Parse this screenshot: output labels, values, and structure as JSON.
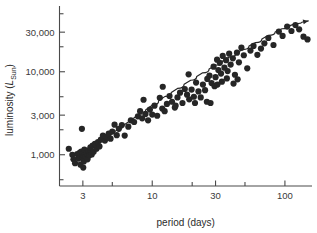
{
  "chart_data": {
    "type": "scatter",
    "title": "",
    "xlabel": "period (days)",
    "ylabel_main": "luminosity (",
    "ylabel_sub": "L",
    "ylabel_subsub": "Sun",
    "ylabel_close": ")",
    "xscale": "log",
    "yscale": "log",
    "xlim": [
      2.0,
      160
    ],
    "ylim": [
      420,
      62000
    ],
    "grid": false,
    "legend": "none",
    "xticks_major": [
      3,
      10,
      30,
      100
    ],
    "xticklabels": [
      "3",
      "10",
      "30",
      "100"
    ],
    "xticks_minor": [
      5,
      20,
      50
    ],
    "yticks_major": [
      1000,
      3000,
      10000,
      30000
    ],
    "yticklabels": [
      "1,000",
      "3,000",
      "10,000",
      "30,000"
    ],
    "yticks_minor": [
      500,
      2000,
      5000,
      20000,
      50000
    ],
    "marker": "filled-circle",
    "marker_color": "#262626",
    "marker_size_px": 3.1,
    "fit_curve": {
      "name": "period-luminosity relation",
      "color": "#262626",
      "has_arrowhead": true,
      "points": [
        [
          2.45,
          880
        ],
        [
          3.0,
          1030
        ],
        [
          3.6,
          1250
        ],
        [
          4.4,
          1560
        ],
        [
          5.4,
          1980
        ],
        [
          6.6,
          2480
        ],
        [
          8.0,
          3080
        ],
        [
          10.0,
          3950
        ],
        [
          12.5,
          5050
        ],
        [
          15.5,
          6300
        ],
        [
          19.5,
          7900
        ],
        [
          24.0,
          9700
        ],
        [
          30.0,
          12000
        ],
        [
          38.0,
          15000
        ],
        [
          48.0,
          18500
        ],
        [
          60.0,
          22500
        ],
        [
          75.0,
          27500
        ],
        [
          95.0,
          33000
        ],
        [
          120.0,
          38000
        ],
        [
          150.0,
          41000
        ]
      ]
    },
    "points": [
      [
        2.35,
        1180
      ],
      [
        2.5,
        1000
      ],
      [
        2.55,
        880
      ],
      [
        2.62,
        790
      ],
      [
        2.72,
        1020
      ],
      [
        2.78,
        900
      ],
      [
        2.85,
        1060
      ],
      [
        2.88,
        760
      ],
      [
        2.92,
        1090
      ],
      [
        2.95,
        2050
      ],
      [
        2.98,
        940
      ],
      [
        3.0,
        1010
      ],
      [
        3.02,
        700
      ],
      [
        3.05,
        830
      ],
      [
        3.08,
        1150
      ],
      [
        3.12,
        960
      ],
      [
        3.2,
        1040
      ],
      [
        3.25,
        880
      ],
      [
        3.3,
        1120
      ],
      [
        3.35,
        980
      ],
      [
        3.42,
        1230
      ],
      [
        3.5,
        1010
      ],
      [
        3.55,
        1290
      ],
      [
        3.62,
        1090
      ],
      [
        3.7,
        1350
      ],
      [
        3.8,
        1180
      ],
      [
        3.9,
        1420
      ],
      [
        4.0,
        1260
      ],
      [
        4.1,
        1520
      ],
      [
        4.25,
        1700
      ],
      [
        4.4,
        1480
      ],
      [
        4.5,
        1640
      ],
      [
        4.7,
        1800
      ],
      [
        4.85,
        1560
      ],
      [
        5.0,
        1900
      ],
      [
        5.2,
        2300
      ],
      [
        5.4,
        1720
      ],
      [
        5.6,
        2050
      ],
      [
        5.9,
        2280
      ],
      [
        6.2,
        1700
      ],
      [
        6.6,
        2180
      ],
      [
        6.9,
        2600
      ],
      [
        7.3,
        2480
      ],
      [
        7.8,
        2900
      ],
      [
        8.1,
        3350
      ],
      [
        8.4,
        2750
      ],
      [
        8.6,
        4600
      ],
      [
        8.9,
        3100
      ],
      [
        9.3,
        2600
      ],
      [
        9.6,
        3500
      ],
      [
        10.0,
        3050
      ],
      [
        10.4,
        3900
      ],
      [
        10.9,
        2950
      ],
      [
        11.4,
        4850
      ],
      [
        11.9,
        3600
      ],
      [
        12.4,
        3350
      ],
      [
        12.9,
        4100
      ],
      [
        13.5,
        5100
      ],
      [
        14.1,
        4350
      ],
      [
        14.8,
        3700
      ],
      [
        15.5,
        4900
      ],
      [
        16.2,
        5600
      ],
      [
        16.9,
        4200
      ],
      [
        17.6,
        6200
      ],
      [
        18.3,
        5300
      ],
      [
        19.0,
        4650
      ],
      [
        19.8,
        6100
      ],
      [
        20.6,
        5000
      ],
      [
        21.4,
        7400
      ],
      [
        22.3,
        5800
      ],
      [
        23.2,
        4900
      ],
      [
        24.1,
        7000
      ],
      [
        25.0,
        6000
      ],
      [
        26.0,
        8200
      ],
      [
        27.0,
        9000
      ],
      [
        28.0,
        7300
      ],
      [
        29.0,
        11500
      ],
      [
        30.0,
        8600
      ],
      [
        30.8,
        14000
      ],
      [
        31.5,
        10500
      ],
      [
        32.3,
        12800
      ],
      [
        33.0,
        9500
      ],
      [
        34.0,
        15500
      ],
      [
        35.0,
        11200
      ],
      [
        36.0,
        13800
      ],
      [
        37.0,
        10200
      ],
      [
        38.0,
        16500
      ],
      [
        39.0,
        12200
      ],
      [
        40.5,
        14500
      ],
      [
        42.0,
        9200
      ],
      [
        43.5,
        17000
      ],
      [
        45.0,
        13000
      ],
      [
        47.0,
        19500
      ],
      [
        49.0,
        15800
      ],
      [
        52.0,
        11000
      ],
      [
        55.0,
        18000
      ],
      [
        58.0,
        20500
      ],
      [
        62.0,
        16000
      ],
      [
        66.0,
        19000
      ],
      [
        70.0,
        22000
      ],
      [
        75.0,
        25500
      ],
      [
        82.0,
        21000
      ],
      [
        90.0,
        30500
      ],
      [
        96.0,
        27000
      ],
      [
        104.0,
        35000
      ],
      [
        112.0,
        31000
      ],
      [
        120.0,
        36500
      ],
      [
        128.0,
        32500
      ],
      [
        138.0,
        26500
      ],
      [
        148.0,
        24500
      ],
      [
        18.8,
        9300
      ],
      [
        21.0,
        4200
      ],
      [
        25.8,
        4350
      ],
      [
        27.5,
        4200
      ],
      [
        12.0,
        6600
      ],
      [
        15.0,
        3900
      ],
      [
        33.5,
        7600
      ],
      [
        36.5,
        8300
      ],
      [
        41.0,
        7200
      ],
      [
        44.0,
        8100
      ],
      [
        29.5,
        6700
      ],
      [
        31.0,
        7000
      ]
    ]
  }
}
